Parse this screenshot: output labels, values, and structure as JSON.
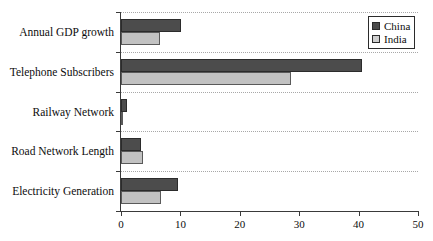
{
  "chart_data": {
    "type": "bar",
    "orientation": "horizontal",
    "title": "",
    "xlabel": "",
    "ylabel": "",
    "xlim": [
      0,
      50
    ],
    "xticks": [
      0,
      10,
      20,
      30,
      40,
      50
    ],
    "grid": true,
    "grid_orientation": "horizontal",
    "legend_position": "top-right",
    "categories": [
      "Annual GDP growth",
      "Telephone Subscribers",
      "Railway Network",
      "Road Network Length",
      "Electricity Generation"
    ],
    "series": [
      {
        "name": "China",
        "color": "#4c4c4c",
        "values": [
          10.1,
          40.6,
          1.0,
          3.4,
          9.6
        ]
      },
      {
        "name": "India",
        "color": "#c2c2c2",
        "values": [
          6.6,
          28.6,
          0.1,
          3.7,
          6.7
        ]
      }
    ]
  },
  "legend": {
    "entries": [
      {
        "label": "China",
        "swatch": "china"
      },
      {
        "label": "India",
        "swatch": "india"
      }
    ]
  },
  "axis": {
    "x_tick_labels": [
      "0",
      "10",
      "20",
      "30",
      "40",
      "50"
    ]
  }
}
